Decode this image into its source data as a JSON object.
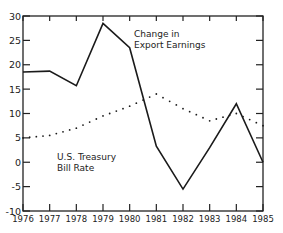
{
  "chart_data": {
    "type": "line",
    "title": "",
    "xlabel": "",
    "ylabel": "",
    "categories": [
      "1976",
      "1977",
      "1978",
      "1979",
      "1980",
      "1981",
      "1982",
      "1983",
      "1984",
      "1985"
    ],
    "ylim": [
      -10,
      30
    ],
    "yticks": [
      -10,
      -5,
      0,
      5,
      10,
      15,
      20,
      25,
      30
    ],
    "grid": false,
    "series": [
      {
        "name": "Change in Export Earnings",
        "style": "solid",
        "label_lines": [
          "Change in",
          "Export Earnings"
        ],
        "values": [
          18.5,
          18.7,
          15.7,
          28.5,
          23.5,
          3.3,
          -5.5,
          3.0,
          12.0,
          0.0
        ]
      },
      {
        "name": "U.S. Treasury Bill Rate",
        "style": "dotted",
        "label_lines": [
          "U.S. Treasury",
          "Bill Rate"
        ],
        "values": [
          5.0,
          5.5,
          7.0,
          9.5,
          11.5,
          14.0,
          11.0,
          8.5,
          10.0,
          7.5
        ]
      }
    ]
  },
  "colors": {
    "line": "#1a1a1a",
    "axis": "#222222",
    "background": "#ffffff"
  }
}
